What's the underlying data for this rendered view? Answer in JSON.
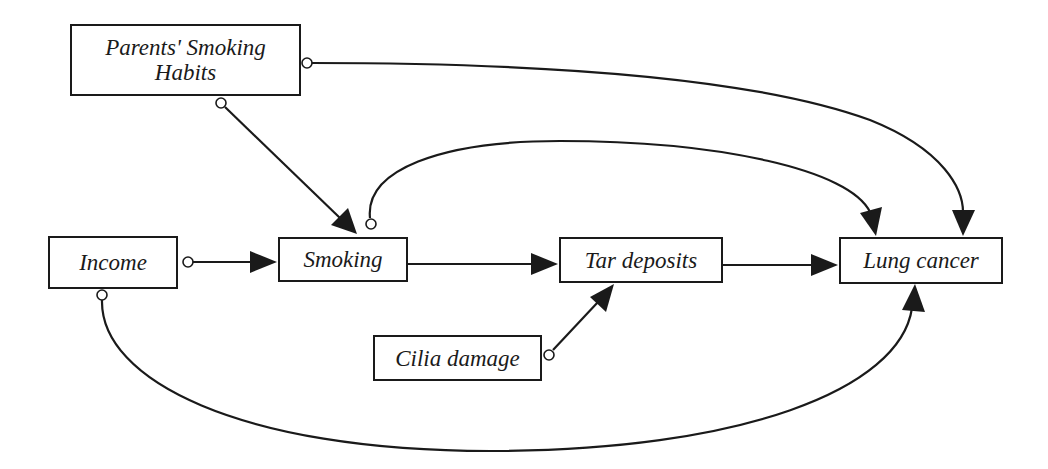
{
  "diagram": {
    "type": "causal-graph",
    "colors": {
      "stroke": "#1a1a1a",
      "background": "#ffffff"
    },
    "nodes": [
      {
        "id": "parents",
        "label_line1": "Parents' Smoking",
        "label_line2": "Habits"
      },
      {
        "id": "income",
        "label": "Income"
      },
      {
        "id": "smoking",
        "label": "Smoking"
      },
      {
        "id": "tar",
        "label": "Tar deposits"
      },
      {
        "id": "cilia",
        "label": "Cilia damage"
      },
      {
        "id": "lung",
        "label": "Lung cancer"
      }
    ],
    "edges": [
      {
        "from": "Parents' Smoking Habits",
        "to": "Smoking",
        "tail": "circle",
        "head": "arrow"
      },
      {
        "from": "Parents' Smoking Habits",
        "to": "Lung cancer",
        "tail": "circle",
        "head": "arrow"
      },
      {
        "from": "Income",
        "to": "Smoking",
        "tail": "circle",
        "head": "arrow"
      },
      {
        "from": "Income",
        "to": "Lung cancer",
        "tail": "circle",
        "head": "arrow"
      },
      {
        "from": "Smoking",
        "to": "Tar deposits",
        "tail": "none",
        "head": "arrow"
      },
      {
        "from": "Smoking",
        "to": "Lung cancer",
        "tail": "circle",
        "head": "arrow"
      },
      {
        "from": "Tar deposits",
        "to": "Lung cancer",
        "tail": "none",
        "head": "arrow"
      },
      {
        "from": "Cilia damage",
        "to": "Tar deposits",
        "tail": "circle",
        "head": "arrow"
      }
    ]
  }
}
